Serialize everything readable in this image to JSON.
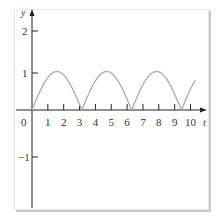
{
  "chart_data": {
    "type": "line",
    "title": "",
    "xlabel": "t",
    "ylabel": "y",
    "xlim": [
      0,
      10.3
    ],
    "ylim": [
      -1.7,
      2.3
    ],
    "x_ticks": [
      "1",
      "2",
      "3",
      "4",
      "5",
      "6",
      "7",
      "8",
      "9",
      "10"
    ],
    "y_ticks": [
      "2",
      "1",
      "-1"
    ],
    "origin_label": "0",
    "grid": false,
    "legend": null,
    "series": [
      {
        "name": "y = |sin t|",
        "function": "abs(sin(t))",
        "color": "#b0b0b0",
        "x": [
          0,
          0.5,
          1.0,
          1.57,
          2.0,
          2.5,
          3.14,
          3.64,
          4.14,
          4.71,
          5.21,
          5.71,
          6.28,
          6.78,
          7.28,
          7.85,
          8.35,
          8.85,
          9.42,
          9.92,
          10.3
        ],
        "y": [
          0,
          0.48,
          0.84,
          1.0,
          0.91,
          0.6,
          0,
          0.48,
          0.84,
          1.0,
          0.88,
          0.54,
          0,
          0.47,
          0.84,
          1.0,
          0.88,
          0.54,
          0,
          0.47,
          0.77
        ]
      }
    ]
  },
  "labels": {
    "y_axis": "y",
    "x_axis": "t",
    "origin": "0",
    "y2": "2",
    "y1": "1",
    "yneg1": "−1",
    "x": [
      "1",
      "2",
      "3",
      "4",
      "5",
      "6",
      "7",
      "8",
      "9",
      "10"
    ]
  }
}
